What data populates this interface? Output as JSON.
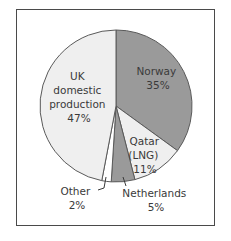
{
  "chart_data": {
    "type": "pie",
    "title": "",
    "start_angle": "12 o'clock, clockwise",
    "slices": [
      {
        "label": "Norway",
        "value": 35,
        "color": "#9a9a9a",
        "text_lines": [
          "Norway",
          "35%"
        ]
      },
      {
        "label": "Qatar (LNG)",
        "value": 11,
        "color": "#efefef",
        "text_lines": [
          "Qatar",
          "(LNG)",
          "11%"
        ]
      },
      {
        "label": "Netherlands",
        "value": 5,
        "color": "#9a9a9a",
        "text_lines": [
          "Netherlands",
          "5%"
        ]
      },
      {
        "label": "Other",
        "value": 2,
        "color": "#ffffff",
        "text_lines": [
          "Other",
          "2%"
        ]
      },
      {
        "label": "UK domestic production",
        "value": 47,
        "color": "#efefef",
        "text_lines": [
          "UK",
          "domestic",
          "production",
          "47%"
        ]
      }
    ],
    "legend": "none (labels placed on/near slices)"
  },
  "labels": {
    "norway": [
      "Norway",
      "35%"
    ],
    "qatar": [
      "Qatar",
      "(LNG)",
      "11%"
    ],
    "netherlands": [
      "Netherlands",
      "5%"
    ],
    "other": [
      "Other",
      "2%"
    ],
    "uk": [
      "UK",
      "domestic",
      "production",
      "47%"
    ]
  },
  "colors": {
    "dark_slice": "#9a9a9a",
    "light_slice": "#efefef",
    "white_slice": "#ffffff",
    "outline": "#5a5a5a",
    "frame": "#4a4a4a",
    "text": "#3a3a3a"
  }
}
